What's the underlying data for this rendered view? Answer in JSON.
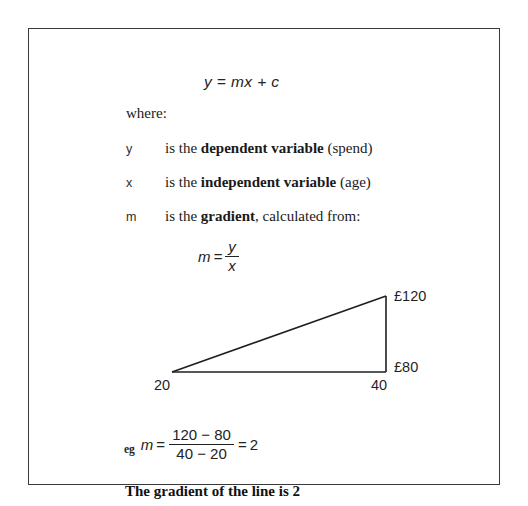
{
  "figure": {
    "formula": {
      "equation": "y = mx + c"
    },
    "where_label": "where:",
    "definitions": [
      {
        "symbol": "y",
        "prefix": "is the ",
        "term": "dependent variable",
        "suffix": " (spend)"
      },
      {
        "symbol": "x",
        "prefix": "is the ",
        "term": "independent variable",
        "suffix": " (age)"
      },
      {
        "symbol": "m",
        "prefix": "is the ",
        "term": "gradient",
        "suffix": ", calculated from:"
      }
    ],
    "gradient_formula": {
      "lhs": "m",
      "equals": "=",
      "numerator": "y",
      "denominator": "x"
    },
    "triangle": {
      "label_y_top": "£120",
      "label_y_bottom": "£80",
      "label_x_left": "20",
      "label_x_right": "40"
    },
    "example": {
      "prefix": "eg",
      "lhs": "m",
      "equals_1": "=",
      "numerator": "120 − 80",
      "denominator": "40 − 20",
      "equals_2": "=",
      "result": "2"
    },
    "conclusion": "The gradient of the line is 2",
    "colors": {
      "border": "#3a3a3a",
      "text": "#1a1a1a",
      "line": "#1f1f1f",
      "background": "#ffffff"
    }
  }
}
